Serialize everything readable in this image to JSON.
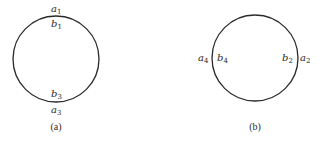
{
  "figures": [
    {
      "id": "a",
      "caption": "(a)",
      "circle": {
        "cx": 56,
        "cy": 59,
        "r": 43
      },
      "labels": [
        {
          "base": "a",
          "sub": "1",
          "x": 51,
          "y": 12,
          "position": "outside-top"
        },
        {
          "base": "b",
          "sub": "1",
          "x": 51,
          "y": 27,
          "position": "inside-top"
        },
        {
          "base": "b",
          "sub": "3",
          "x": 51,
          "y": 97,
          "position": "inside-bottom"
        },
        {
          "base": "a",
          "sub": "3",
          "x": 51,
          "y": 113,
          "position": "outside-bottom"
        }
      ]
    },
    {
      "id": "b",
      "caption": "(b)",
      "circle": {
        "cx": 255,
        "cy": 58,
        "r": 43
      },
      "labels": [
        {
          "base": "a",
          "sub": "4",
          "x": 198,
          "y": 61,
          "position": "outside-left"
        },
        {
          "base": "b",
          "sub": "4",
          "x": 217,
          "y": 61,
          "position": "inside-left"
        },
        {
          "base": "b",
          "sub": "2",
          "x": 282,
          "y": 61,
          "position": "inside-right"
        },
        {
          "base": "a",
          "sub": "2",
          "x": 300,
          "y": 61,
          "position": "outside-right"
        }
      ]
    }
  ],
  "stroke_color": "#2a2a2a"
}
